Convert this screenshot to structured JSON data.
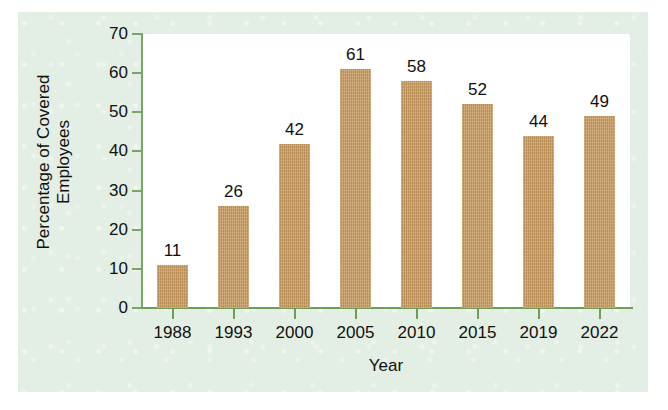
{
  "chart_data": {
    "type": "bar",
    "title": "",
    "xlabel": "Year",
    "ylabel": "Percentage of Covered Employees",
    "ylabel_line1": "Percentage of Covered",
    "ylabel_line2": "Employees",
    "categories": [
      "1988",
      "1993",
      "2000",
      "2005",
      "2010",
      "2015",
      "2019",
      "2022"
    ],
    "values": [
      11,
      26,
      42,
      61,
      58,
      52,
      44,
      49
    ],
    "value_labels": [
      "11",
      "26",
      "42",
      "61",
      "58",
      "52",
      "44",
      "49"
    ],
    "ylim": [
      0,
      70
    ],
    "ytick_labels": [
      "0",
      "10",
      "20",
      "30",
      "40",
      "50",
      "60",
      "70"
    ],
    "ytick_values": [
      0,
      10,
      20,
      30,
      40,
      50,
      60,
      70
    ],
    "grid": false,
    "legend": "none",
    "series": [
      {
        "name": "Percentage of Covered Employees",
        "values": [
          11,
          26,
          42,
          61,
          58,
          52,
          44,
          49
        ]
      }
    ]
  },
  "colors": {
    "bar_fill": "#C89A5E",
    "axis_line": "#6F9D53",
    "panel_background": "#E3EFE4",
    "plot_background": "#FFFFFF",
    "text": "#12100E"
  }
}
